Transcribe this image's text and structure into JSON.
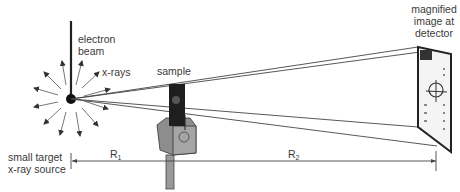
{
  "labels": {
    "electron_beam_line1": "electron",
    "electron_beam_line2": "beam",
    "xrays": "x-rays",
    "sample": "sample",
    "detector_line1": "magnified",
    "detector_line2": "image at",
    "detector_line3": "detector",
    "source_line1": "small target",
    "source_line2": "x-ray source",
    "r1_main": "R",
    "r1_sub": "1",
    "r2_main": "R",
    "r2_sub": "2"
  },
  "colors": {
    "line": "#333333",
    "ray": "#555555",
    "sample_holder": "#8a8a8a",
    "sample_face": "#222222"
  }
}
